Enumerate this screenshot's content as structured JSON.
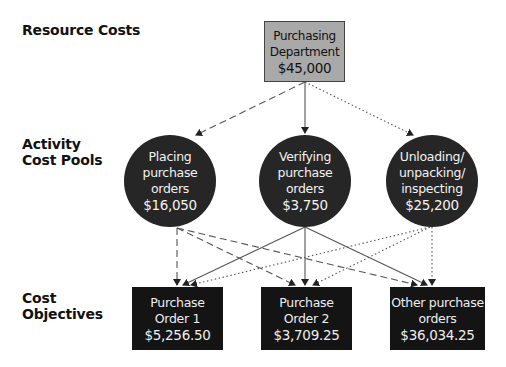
{
  "row_labels": {
    "resource_costs": [
      "Resource Costs"
    ],
    "activity_cost_pools": [
      "Activity",
      "Cost Pools"
    ],
    "cost_objectives": [
      "Cost",
      "Objectives"
    ]
  },
  "resource": {
    "lines": [
      "Purchasing",
      "Department"
    ],
    "amount": "$45,000",
    "fill_color": "#a9a9a9"
  },
  "activity_pools": [
    {
      "lines": [
        "Placing",
        "purchase",
        "orders"
      ],
      "amount": "$16,050",
      "link_style": "dashed"
    },
    {
      "lines": [
        "Verifying",
        "purchase",
        "orders"
      ],
      "amount": "$3,750",
      "link_style": "solid"
    },
    {
      "lines": [
        "Unloading/",
        "unpacking/",
        "inspecting"
      ],
      "amount": "$25,200",
      "link_style": "dotted"
    }
  ],
  "cost_objectives": [
    {
      "lines": [
        "Purchase",
        "Order 1"
      ],
      "amount": "$5,256.50"
    },
    {
      "lines": [
        "Purchase",
        "Order 2"
      ],
      "amount": "$3,709.25"
    },
    {
      "lines": [
        "Other purchase",
        "orders"
      ],
      "amount": "$36,034.25"
    }
  ],
  "colors": {
    "pool_fill": "#262626",
    "objective_fill": "#141414",
    "line_color": "#555555"
  }
}
